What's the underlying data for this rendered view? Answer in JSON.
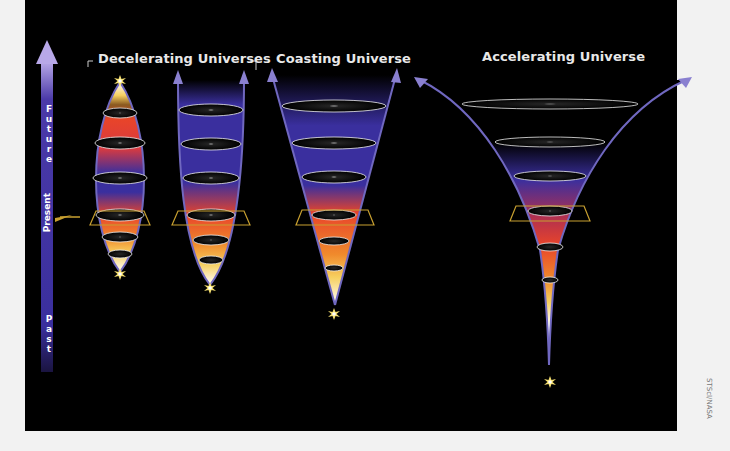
{
  "diagram": {
    "titles": {
      "decelerating": "Decelerating Universes",
      "coasting": "Coasting Universe",
      "accelerating": "Accelerating Universe"
    },
    "time_axis": {
      "future": "Future",
      "present": "Present",
      "past": "Past"
    },
    "credit": "STScI/NASA",
    "colors": {
      "background": "#000000",
      "axis_blue": "#3a2f9e",
      "arrow_lavender": "#8a80d0",
      "red": "#e8442a",
      "orange": "#f08a2c",
      "yellow": "#f6d060",
      "present_marker": "#c8a030"
    },
    "universes": [
      {
        "name": "closed-decelerating",
        "shape": "lens",
        "disks": 6
      },
      {
        "name": "open-decelerating",
        "shape": "u",
        "disks": 6
      },
      {
        "name": "coasting",
        "shape": "cone",
        "disks": 6
      },
      {
        "name": "accelerating",
        "shape": "trumpet",
        "disks": 6
      }
    ]
  }
}
